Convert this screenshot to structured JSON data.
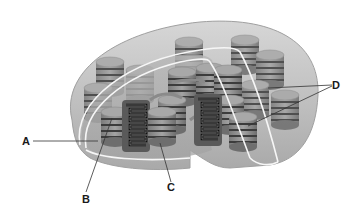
{
  "diagram": {
    "labels": [
      {
        "id": "A",
        "text": "A"
      },
      {
        "id": "B",
        "text": "B"
      },
      {
        "id": "C",
        "text": "C"
      },
      {
        "id": "D",
        "text": "D"
      }
    ]
  },
  "colors": {
    "background": "#ffffff",
    "outer_body": "#c4c4c4",
    "outer_shade": "#a8a8a8",
    "membrane_line": "#f4f4f4",
    "stroma": "#b8b8b8",
    "granum_top": "#9a9a9a",
    "granum_side": "#8a8a8a",
    "granum_band": "#3a3a3a",
    "thylakoid_dark": "#141414",
    "label_line": "#333333"
  }
}
